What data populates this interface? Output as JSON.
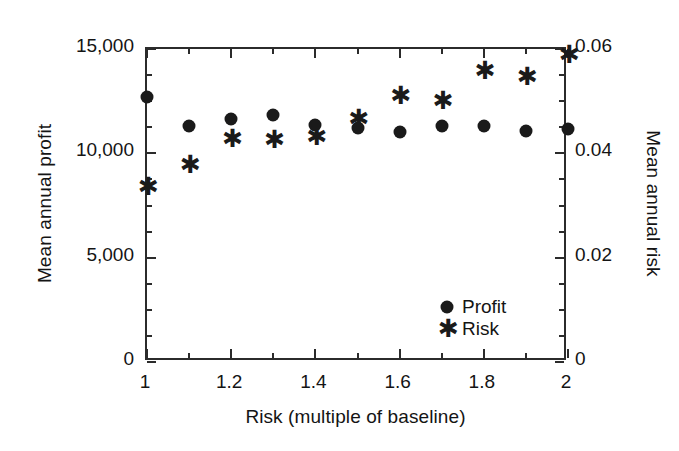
{
  "chart_data": {
    "type": "scatter",
    "title": "",
    "xlabel": "Risk (multiple of baseline)",
    "ylabel": "Mean annual profit",
    "y2label": "Mean annual risk",
    "x": [
      1.0,
      1.1,
      1.2,
      1.3,
      1.4,
      1.5,
      1.6,
      1.7,
      1.8,
      1.9,
      2.0
    ],
    "xlim": [
      1.0,
      2.0
    ],
    "ylim": [
      0,
      15000
    ],
    "y2lim": [
      0,
      0.06
    ],
    "grid": false,
    "legend_position": "lower right",
    "xticks": [
      1,
      1.2,
      1.4,
      1.6,
      1.8,
      2
    ],
    "xticklabels": [
      "1",
      "1.2",
      "1.4",
      "1.6",
      "1.8",
      "2"
    ],
    "xminorticks": [
      1.1,
      1.3,
      1.5,
      1.7,
      1.9
    ],
    "yticks": [
      0,
      5000,
      10000,
      15000
    ],
    "yticklabels": [
      "0",
      "5,000",
      "10,000",
      "15,000"
    ],
    "yminorticks": [
      1250,
      2500,
      3750,
      6250,
      7500,
      8750,
      11250,
      12500,
      13750
    ],
    "y2ticks": [
      0,
      0.02,
      0.04,
      0.06
    ],
    "y2ticklabels": [
      "0",
      "0.02",
      "0.04",
      "0.06"
    ],
    "y2minorticks": [
      0.005,
      0.01,
      0.015,
      0.025,
      0.03,
      0.035,
      0.045,
      0.05,
      0.055
    ],
    "series": [
      {
        "name": "Profit",
        "marker": "circle",
        "axis": "left",
        "color": "#1a1a1a",
        "values": [
          12700,
          11300,
          11650,
          11850,
          11350,
          11200,
          11000,
          11300,
          11300,
          11050,
          11150
        ]
      },
      {
        "name": "Risk",
        "marker": "star",
        "axis": "right",
        "color": "#1a1a1a",
        "values": [
          0.0335,
          0.0378,
          0.0427,
          0.0425,
          0.0431,
          0.0466,
          0.0509,
          0.0501,
          0.0557,
          0.0546,
          0.0588
        ]
      }
    ],
    "legend": [
      {
        "label": "Profit",
        "marker": "circle"
      },
      {
        "label": "Risk",
        "marker": "star"
      }
    ]
  },
  "colors": {
    "background": "#ffffff",
    "axis": "#2b2b2b",
    "text": "#141414",
    "marker": "#1a1a1a"
  }
}
